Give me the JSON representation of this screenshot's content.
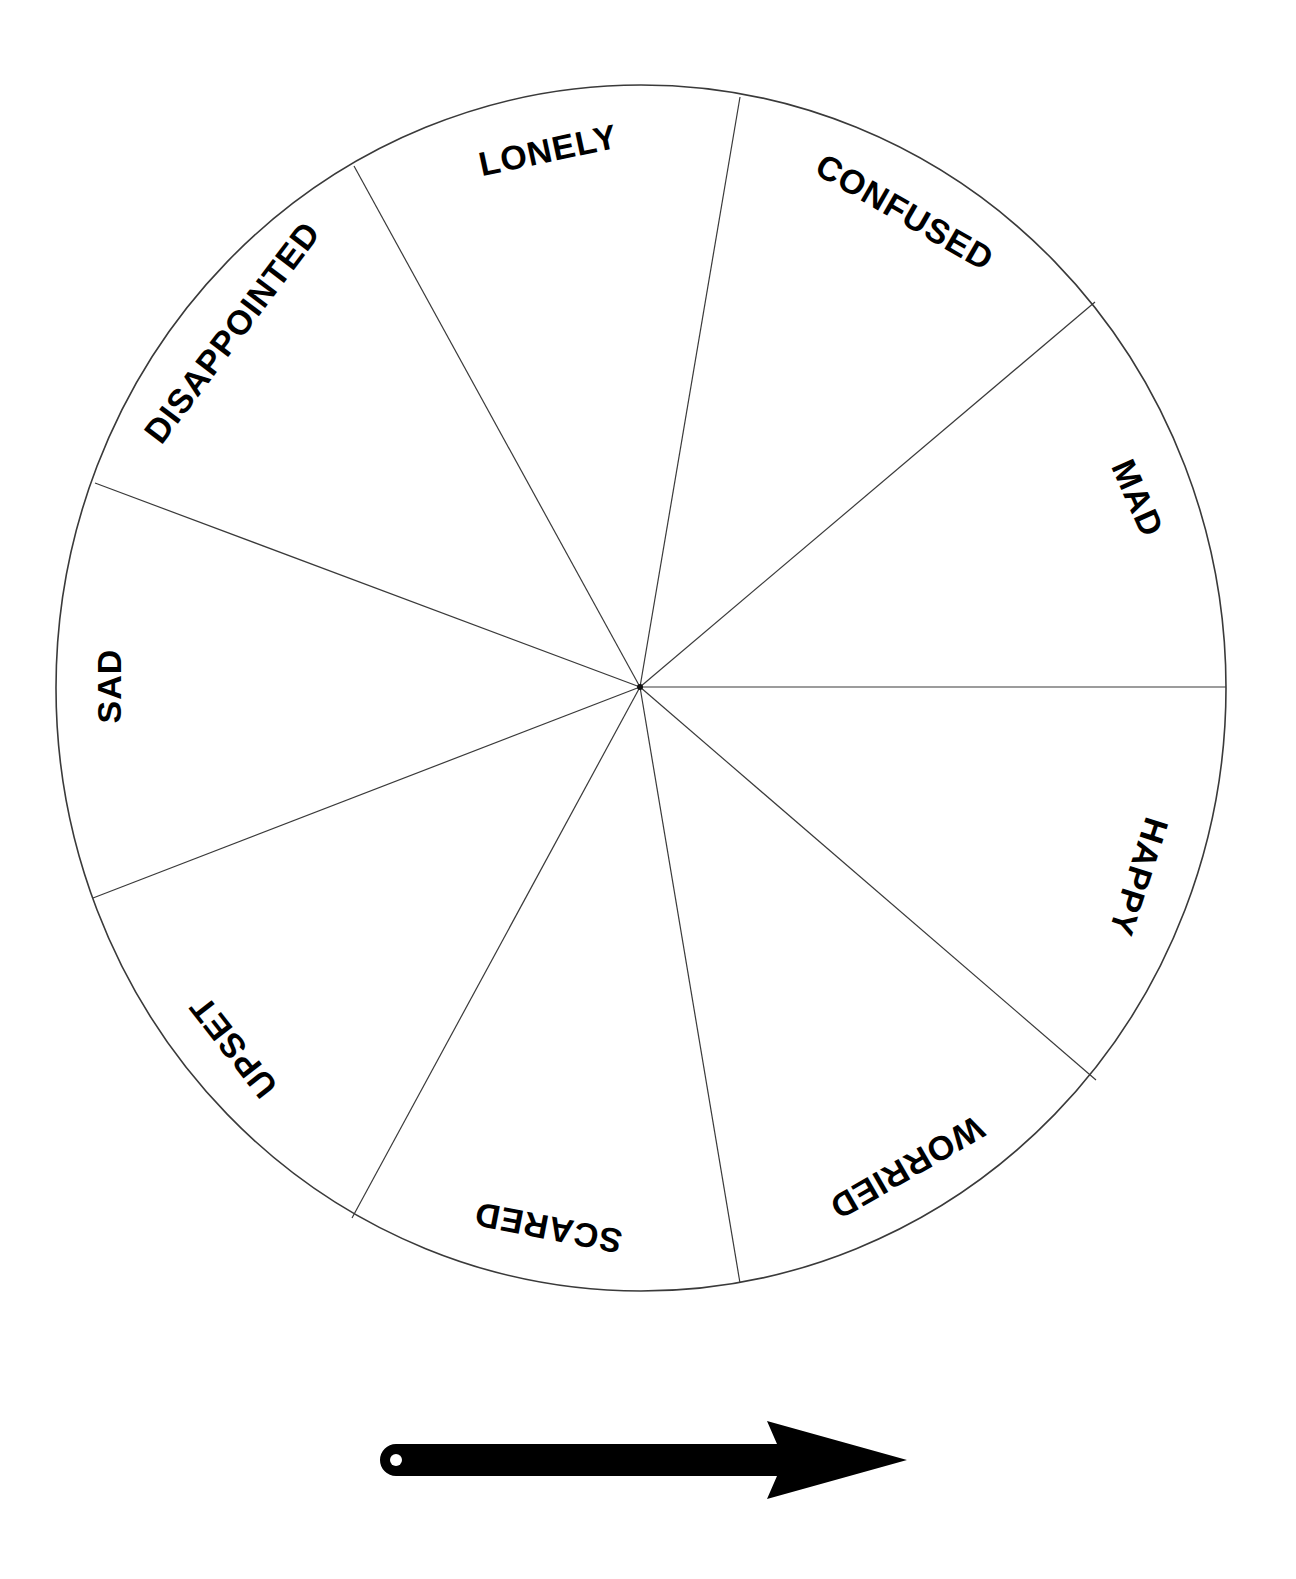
{
  "colors": {
    "line": "#3a3a3a",
    "text": "#000000",
    "arrow": "#000000",
    "background": "#ffffff"
  },
  "wheel": {
    "segments": [
      {
        "label": "LONELY"
      },
      {
        "label": "CONFUSED"
      },
      {
        "label": "MAD"
      },
      {
        "label": "HAPPY"
      },
      {
        "label": "WORRIED"
      },
      {
        "label": "SCARED"
      },
      {
        "label": "UPSET"
      },
      {
        "label": "SAD"
      },
      {
        "label": "DISAPPOINTED"
      }
    ]
  },
  "pointer": {
    "icon": "spinner-arrow-icon",
    "direction": "right"
  }
}
